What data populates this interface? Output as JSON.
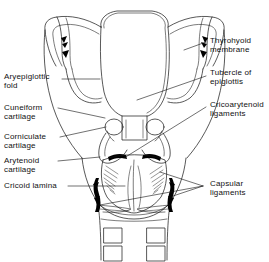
{
  "figure": {
    "background_color": "#ffffff",
    "line_color": "#111111",
    "ligament_fill": "#000000"
  },
  "labels": {
    "aryepiglottic_fold": "Aryepiglottic\nfold",
    "cuneiform_cartilage": "Cuneiform\ncartilage",
    "corniculate_cartilage": "Corniculate\ncartilage",
    "arytenoid_cartilage": "Arytenoid\ncartilage",
    "cricoid_lamina": "Cricoid lamina",
    "thyrohyoid_membrane": "Thyrohyoid\nmembrane",
    "tubercle_of_epiglottis": "Tubercle of\nepiglottis",
    "cricoarytenoid_ligaments": "Cricoarytenoid\nligaments",
    "capsular_ligaments": "Capsular\nligaments"
  },
  "parts": [
    {
      "name": "epiglottis",
      "side": "midline"
    },
    {
      "name": "thyrohyoid-membrane",
      "side": "both"
    },
    {
      "name": "superior-horn",
      "side": "both"
    },
    {
      "name": "thyroid-cartilage-lamina",
      "side": "both"
    },
    {
      "name": "corniculate-cartilage",
      "side": "both"
    },
    {
      "name": "arytenoid-cartilage",
      "side": "both"
    },
    {
      "name": "cricoid-lamina",
      "side": "midline"
    },
    {
      "name": "cricoarytenoid-ligament",
      "side": "both"
    },
    {
      "name": "capsular-ligament",
      "side": "both"
    },
    {
      "name": "tracheal-ring",
      "side": "both",
      "count": 4
    }
  ]
}
